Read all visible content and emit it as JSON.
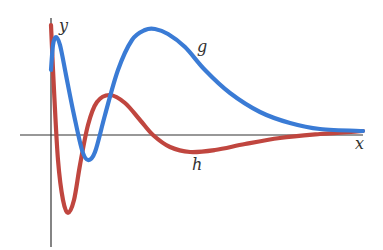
{
  "chart_data": {
    "type": "line",
    "title": "",
    "xlabel": "x",
    "ylabel": "y",
    "grid": false,
    "legend": "none (curves labeled inline)",
    "axis_ticks": "none",
    "series": [
      {
        "name": "g",
        "color": "#3a7bd5",
        "description": "Starts slightly above the x-axis, rises to a small peak near x=0, dips below the x-axis to a shallow minimum, then rises to a large broad maximum before decaying toward 0 as x increases",
        "points_px": [
          [
            51,
            70
          ],
          [
            53,
            45
          ],
          [
            56,
            37
          ],
          [
            60,
            45
          ],
          [
            66,
            75
          ],
          [
            74,
            115
          ],
          [
            82,
            150
          ],
          [
            88,
            160
          ],
          [
            95,
            152
          ],
          [
            105,
            115
          ],
          [
            118,
            70
          ],
          [
            132,
            40
          ],
          [
            145,
            30
          ],
          [
            155,
            29
          ],
          [
            168,
            34
          ],
          [
            185,
            47
          ],
          [
            205,
            70
          ],
          [
            230,
            93
          ],
          [
            260,
            112
          ],
          [
            290,
            123
          ],
          [
            320,
            129
          ],
          [
            363,
            131
          ]
        ]
      },
      {
        "name": "h",
        "color": "#c0463f",
        "description": "Starts high at x=0, plunges to a deep minimum well below the x-axis, rises to a moderate positive maximum, then dips slightly below the axis and decays toward 0",
        "points_px": [
          [
            51,
            25
          ],
          [
            54,
            90
          ],
          [
            58,
            160
          ],
          [
            63,
            200
          ],
          [
            68,
            213
          ],
          [
            74,
            200
          ],
          [
            80,
            165
          ],
          [
            88,
            125
          ],
          [
            97,
            102
          ],
          [
            110,
            95
          ],
          [
            125,
            103
          ],
          [
            140,
            120
          ],
          [
            153,
            135
          ],
          [
            170,
            147
          ],
          [
            190,
            152
          ],
          [
            215,
            150
          ],
          [
            245,
            144
          ],
          [
            280,
            138
          ],
          [
            320,
            134
          ],
          [
            363,
            131
          ]
        ]
      }
    ],
    "labels": [
      {
        "text": "y",
        "x_px": 59,
        "y_px": 31
      },
      {
        "text": "g",
        "x_px": 197,
        "y_px": 52
      },
      {
        "text": "h",
        "x_px": 192,
        "y_px": 170
      },
      {
        "text": "x",
        "x_px": 355,
        "y_px": 149
      }
    ],
    "axes_px": {
      "x_axis": {
        "x1": 20,
        "x2": 363,
        "y": 135
      },
      "y_axis": {
        "x": 51,
        "y1": 18,
        "y2": 247
      }
    }
  }
}
